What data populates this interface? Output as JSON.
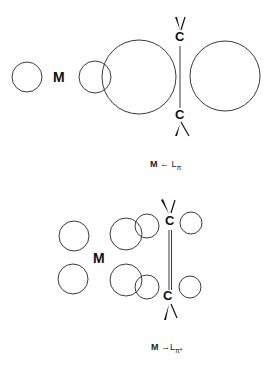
{
  "diagrams": [
    {
      "id": "sigma_pi_donation",
      "metal_label": "M",
      "carbon_labels": [
        "C",
        "C"
      ],
      "caption": {
        "left": "M",
        "arrow": "←",
        "right": "L",
        "subscript": "π"
      },
      "bond_type": "single line"
    },
    {
      "id": "pi_back_donation",
      "metal_label": "M",
      "carbon_labels": [
        "C",
        "C"
      ],
      "caption": {
        "left": "M",
        "arrow": "→",
        "right": "L",
        "subscript": "π*"
      },
      "bond_type": "double line"
    }
  ],
  "colors": {
    "stroke": "#3a3a3a",
    "text": "#111111",
    "background": "#ffffff"
  }
}
